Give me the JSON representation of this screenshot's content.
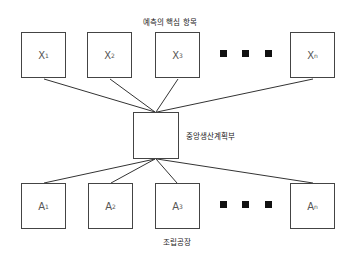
{
  "title": "예측의 핵심 항목",
  "center": {
    "label": "중앙생산계획부"
  },
  "bottom_label": "조립공장",
  "top_row": [
    {
      "letter": "X",
      "sub": "1"
    },
    {
      "letter": "X",
      "sub": "2"
    },
    {
      "letter": "X",
      "sub": "3"
    },
    {
      "letter": "X",
      "sub": "n"
    }
  ],
  "bottom_row": [
    {
      "letter": "A",
      "sub": "1"
    },
    {
      "letter": "A",
      "sub": "2"
    },
    {
      "letter": "A",
      "sub": "3"
    },
    {
      "letter": "A",
      "sub": "n"
    }
  ],
  "ellipsis": "■ ■ ■"
}
